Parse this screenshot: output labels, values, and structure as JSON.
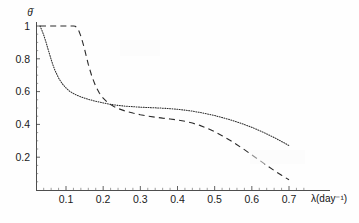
{
  "chart_data": {
    "type": "line",
    "title": "",
    "subtitle": "",
    "xlabel": "λ(day⁻¹)",
    "ylabel": "θ̄",
    "xlim": [
      0.0,
      0.745
    ],
    "ylim": [
      0.0,
      1.06
    ],
    "grid": false,
    "legend_position": "none",
    "xticks": [
      0.1,
      0.2,
      0.3,
      0.4,
      0.5,
      0.6,
      0.7
    ],
    "xticklabels": [
      "0.1",
      "0.2",
      "0.3",
      "0.4",
      "0.5",
      "0.6",
      "0.7"
    ],
    "yticks": [
      0.2,
      0.4,
      0.6,
      0.8,
      1.0
    ],
    "yticklabels": [
      "0.2",
      "0.4",
      "0.6",
      "0.8",
      "1"
    ],
    "annotations": [],
    "series": [
      {
        "name": "dotted-curve",
        "style": "dotted",
        "color": "#2b2b2b",
        "x": [
          0.03,
          0.035,
          0.04,
          0.045,
          0.05,
          0.055,
          0.06,
          0.065,
          0.07,
          0.08,
          0.09,
          0.1,
          0.11,
          0.12,
          0.13,
          0.14,
          0.15,
          0.16,
          0.17,
          0.18,
          0.19,
          0.2,
          0.22,
          0.24,
          0.26,
          0.28,
          0.3,
          0.32,
          0.34,
          0.36,
          0.38,
          0.4,
          0.42,
          0.44,
          0.46,
          0.48,
          0.5,
          0.52,
          0.54,
          0.56,
          0.58,
          0.6,
          0.62,
          0.64,
          0.66,
          0.68,
          0.7
        ],
        "y": [
          1.0,
          0.975,
          0.945,
          0.91,
          0.872,
          0.834,
          0.796,
          0.762,
          0.731,
          0.683,
          0.648,
          0.622,
          0.602,
          0.588,
          0.577,
          0.568,
          0.56,
          0.553,
          0.547,
          0.541,
          0.536,
          0.531,
          0.522,
          0.516,
          0.511,
          0.508,
          0.505,
          0.503,
          0.501,
          0.499,
          0.496,
          0.492,
          0.487,
          0.481,
          0.473,
          0.464,
          0.454,
          0.442,
          0.429,
          0.415,
          0.399,
          0.382,
          0.363,
          0.342,
          0.32,
          0.296,
          0.271
        ]
      },
      {
        "name": "dashed-curve",
        "style": "dashed",
        "color": "#2b2b2b",
        "x": [
          0.03,
          0.05,
          0.07,
          0.09,
          0.11,
          0.12,
          0.125,
          0.13,
          0.135,
          0.14,
          0.145,
          0.15,
          0.155,
          0.16,
          0.17,
          0.18,
          0.19,
          0.2,
          0.21,
          0.22,
          0.23,
          0.24,
          0.26,
          0.28,
          0.3,
          0.32,
          0.34,
          0.36,
          0.38,
          0.4,
          0.42,
          0.44,
          0.46,
          0.48,
          0.5,
          0.52,
          0.54,
          0.56,
          0.58,
          0.6,
          0.62,
          0.64,
          0.66,
          0.68,
          0.7
        ],
        "y": [
          1.0,
          1.0,
          1.0,
          1.0,
          1.0,
          1.0,
          0.998,
          0.988,
          0.968,
          0.938,
          0.9,
          0.858,
          0.812,
          0.766,
          0.69,
          0.632,
          0.59,
          0.56,
          0.538,
          0.521,
          0.508,
          0.497,
          0.481,
          0.469,
          0.459,
          0.451,
          0.444,
          0.438,
          0.433,
          0.427,
          0.419,
          0.408,
          0.394,
          0.376,
          0.355,
          0.331,
          0.305,
          0.276,
          0.246,
          0.214,
          0.182,
          0.15,
          0.119,
          0.09,
          0.062
        ]
      }
    ]
  }
}
